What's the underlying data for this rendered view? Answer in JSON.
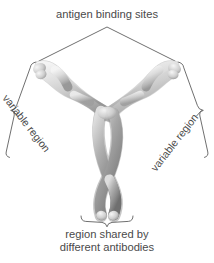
{
  "figure": {
    "background_color": "#ffffff",
    "line_color": "#4a4a4a",
    "text_color": "#4a4a4a",
    "molecule_colors": {
      "light_chain": "#d8d8d8",
      "light_chain_shadow": "#a8a8a8",
      "heavy_chain": "#9c9c9c",
      "heavy_chain_shadow": "#6e6e6e",
      "highlight": "#f2f2f2"
    }
  },
  "labels": {
    "antigen_binding_sites": "antigen binding sites",
    "variable_region_left": "variable region",
    "variable_region_right": "variable region",
    "shared_region_line1": "region shared by",
    "shared_region_line2": "different antibodies"
  },
  "annotations": {
    "top_pointer": "inverted-v-leader",
    "left_bracket": "curly-bracket-leader",
    "right_bracket": "curly-bracket-leader",
    "bottom_bracket": "curly-brace"
  }
}
